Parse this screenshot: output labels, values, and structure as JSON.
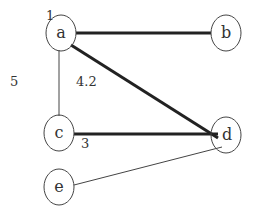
{
  "diagram": {
    "type": "weighted-graph",
    "nodes": [
      {
        "id": "a",
        "label": "a",
        "cx": 61,
        "cy": 33
      },
      {
        "id": "b",
        "label": "b",
        "cx": 226,
        "cy": 33
      },
      {
        "id": "c",
        "label": "c",
        "cx": 59,
        "cy": 133
      },
      {
        "id": "d",
        "label": "d",
        "cx": 225,
        "cy": 135
      },
      {
        "id": "e",
        "label": "e",
        "cx": 59,
        "cy": 187
      }
    ],
    "edges": [
      {
        "from": "a",
        "to": "b",
        "weight": "1",
        "thick": true
      },
      {
        "from": "a",
        "to": "c",
        "weight": "5",
        "thick": false
      },
      {
        "from": "a",
        "to": "d",
        "weight": "4.2",
        "thick": true
      },
      {
        "from": "c",
        "to": "d",
        "weight": "3",
        "thick": true
      },
      {
        "from": "e",
        "to": "d",
        "weight": "",
        "thick": false
      }
    ],
    "weight_labels": {
      "ab": "1",
      "ac": "5",
      "ad": "4.2",
      "cd": "3"
    }
  }
}
